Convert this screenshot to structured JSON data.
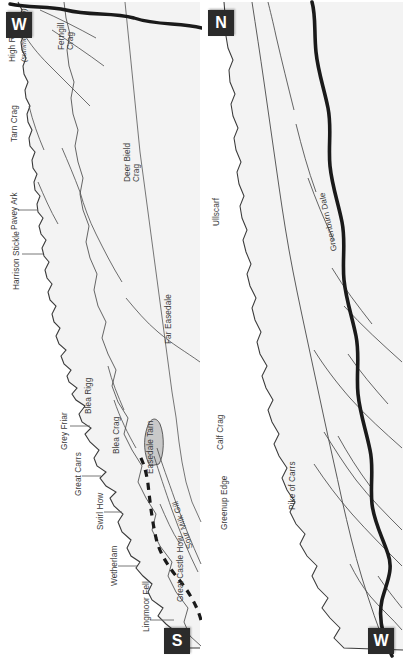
{
  "figure": {
    "type": "panorama-profile-diagram",
    "orientation": "rotated-90",
    "panel_count": 2,
    "line_color": "#3a3a3a",
    "ridge_color": "#222222",
    "fill_color": "#f2f2f2",
    "text_color": "#3b3b3b",
    "badge_bg": "#2b2b2b",
    "badge_fg": "#ffffff"
  },
  "panels": [
    {
      "id": "upper-panel",
      "start_badge": "S",
      "end_badge": "W",
      "summit_labels": [
        {
          "id": "lingmoor-fell",
          "text": "Lingmoor Fell",
          "leader": true
        },
        {
          "id": "wetherlam",
          "text": "Wetherlam",
          "leader": true
        },
        {
          "id": "swirl-how",
          "text": "Swirl How",
          "leader": true
        },
        {
          "id": "great-carrs",
          "text": "Great Carrs",
          "leader": true
        },
        {
          "id": "grey-friar",
          "text": "Grey Friar",
          "leader": true
        },
        {
          "id": "blea-rigg",
          "text": "Blea Rigg",
          "leader": false
        },
        {
          "id": "harrison-stickle",
          "text": "Harrison Stickle",
          "leader": true
        },
        {
          "id": "pavey-ark",
          "text": "Pavey Ark",
          "leader": true
        },
        {
          "id": "tarn-crag",
          "text": "Tarn Crag",
          "leader": false
        },
        {
          "id": "high-raise",
          "text": "High Raise",
          "leader": false
        },
        {
          "id": "high-raise-note",
          "text": "(summit unseen)",
          "leader": false,
          "italic": true
        }
      ],
      "feature_labels": [
        {
          "id": "great-castle-how",
          "text": "Great Castle How"
        },
        {
          "id": "blea-crag",
          "text": "Blea Crag"
        },
        {
          "id": "easedale-tarn",
          "text": "Easedale Tarn"
        },
        {
          "id": "sour-milk-gill",
          "text": "Sour Milk Gill"
        },
        {
          "id": "far-easedale",
          "text": "Far Easedale"
        },
        {
          "id": "deer-bield-crag",
          "text": "Deer Bield Crag"
        },
        {
          "id": "ferngill-crag",
          "text": "Ferngill Crag"
        }
      ]
    },
    {
      "id": "lower-panel",
      "start_badge": "W",
      "end_badge": "N",
      "summit_labels": [
        {
          "id": "greenup-edge",
          "text": "Greenup Edge",
          "leader": false
        },
        {
          "id": "calf-crag",
          "text": "Calf Crag",
          "leader": false
        },
        {
          "id": "ullscarf",
          "text": "Ullscarf",
          "leader": false
        }
      ],
      "feature_labels": [
        {
          "id": "pike-of-carrs",
          "text": "Pike of Carrs"
        },
        {
          "id": "greenburn-dale",
          "text": "Greenburn Dale"
        }
      ]
    }
  ],
  "compass_badges": [
    {
      "id": "badge-w-top-left",
      "letter": "W"
    },
    {
      "id": "badge-s-bottom-left",
      "letter": "S"
    },
    {
      "id": "badge-n-top-right",
      "letter": "N"
    },
    {
      "id": "badge-w-bottom-right",
      "letter": "W"
    }
  ]
}
